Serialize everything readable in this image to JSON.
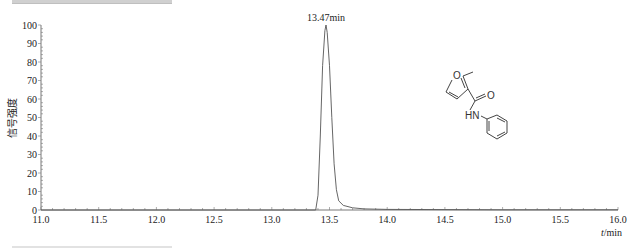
{
  "chart_data": {
    "type": "line",
    "title": "",
    "xlabel": "t/min",
    "ylabel": "信号强度",
    "xlim": [
      11.0,
      16.0
    ],
    "ylim": [
      0,
      100
    ],
    "x_ticks": [
      "11.0",
      "11.5",
      "12.0",
      "12.5",
      "13.0",
      "13.5",
      "14.0",
      "14.5",
      "15.0",
      "15.5",
      "16.0"
    ],
    "y_ticks": [
      "0",
      "10",
      "20",
      "30",
      "40",
      "50",
      "60",
      "70",
      "80",
      "90",
      "100"
    ],
    "grid": false,
    "legend": null,
    "annotations": [
      {
        "text": "13.47min",
        "x": 13.47,
        "y": 100
      }
    ],
    "series": [
      {
        "name": "chromatogram",
        "x": [
          11.0,
          13.0,
          13.38,
          13.4,
          13.42,
          13.44,
          13.46,
          13.47,
          13.48,
          13.5,
          13.52,
          13.54,
          13.56,
          13.58,
          13.62,
          13.7,
          13.8,
          14.0,
          14.5,
          15.0,
          15.5,
          16.0
        ],
        "values": [
          0,
          0,
          0,
          8,
          40,
          78,
          97,
          100,
          96,
          78,
          50,
          25,
          11,
          5,
          2.5,
          1.2,
          0.6,
          0.3,
          0.2,
          0.1,
          0.1,
          0.1
        ]
      }
    ],
    "inset": {
      "type": "chemical-structure",
      "name": "2-methyl-N-phenylfuran-3-carboxamide",
      "atom_labels": [
        "O",
        "O",
        "HN"
      ]
    }
  },
  "labels": {
    "peak": "13.47min",
    "xlabel_italic": "t",
    "xlabel_unit": "/min",
    "ylabel": "信号强度",
    "mol_O_ring": "O",
    "mol_O_carbonyl": "O",
    "mol_HN": "HN"
  }
}
